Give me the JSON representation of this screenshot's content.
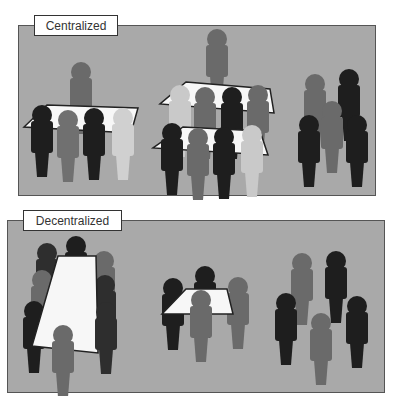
{
  "panels": [
    {
      "id": "centralized",
      "label": "Centralized"
    },
    {
      "id": "decentralized",
      "label": "Decentralized"
    }
  ],
  "colors": {
    "panel_bg": "#a9a9a9",
    "black": "#1e1e1e",
    "dark": "#2e2e2e",
    "mid": "#6a6a6a",
    "light": "#c9c9c9",
    "table": "#f7f7f7"
  }
}
